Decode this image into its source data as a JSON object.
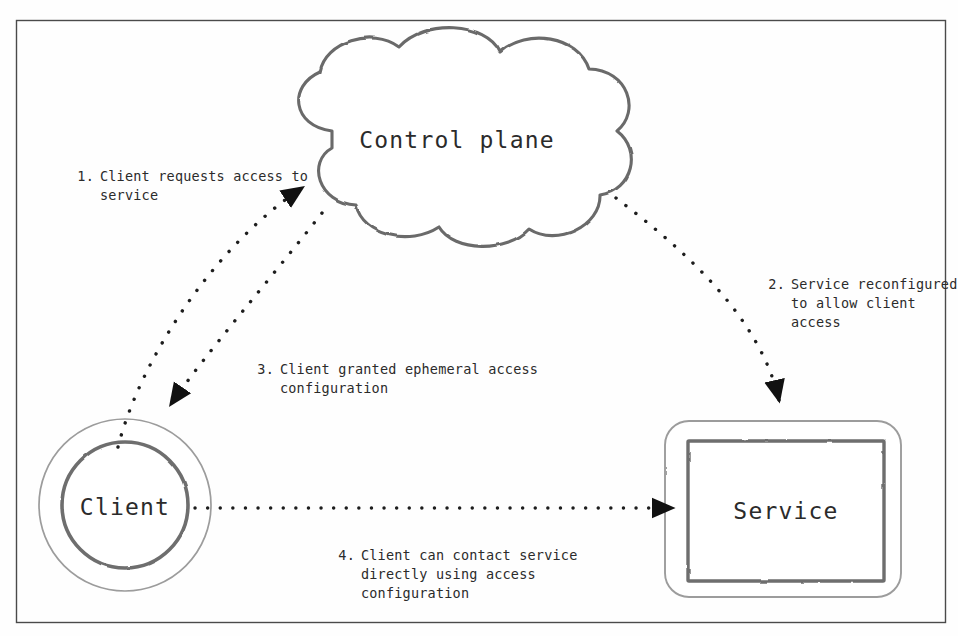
{
  "diagram": {
    "frame": {
      "border_color": "#4a4a4a",
      "background": "#fefefe"
    },
    "ink_color": "#5a5a5a",
    "text_color": "#2b2b2b",
    "nodes": [
      {
        "id": "control-plane",
        "label": "Control plane",
        "shape": "cloud"
      },
      {
        "id": "client",
        "label": "Client",
        "shape": "double-circle"
      },
      {
        "id": "service",
        "label": "Service",
        "shape": "double-rounded-rect"
      }
    ],
    "steps": [
      {
        "number": "1.",
        "text": "Client requests access to\nservice",
        "from": "client",
        "to": "control-plane"
      },
      {
        "number": "2.",
        "text": "Service reconfigured\nto allow client\naccess",
        "from": "control-plane",
        "to": "service"
      },
      {
        "number": "3.",
        "text": "Client granted ephemeral access\nconfiguration",
        "from": "control-plane",
        "to": "client"
      },
      {
        "number": "4.",
        "text": "Client can contact service\ndirectly using access\nconfiguration",
        "from": "client",
        "to": "service"
      }
    ]
  }
}
